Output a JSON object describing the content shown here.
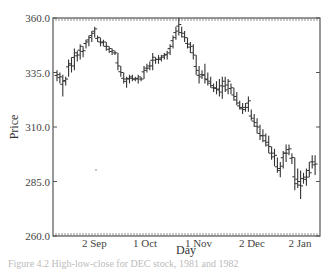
{
  "chart_data": {
    "type": "ohlc",
    "title": "",
    "xlabel": "Day",
    "ylabel": "Price",
    "ylim": [
      260.0,
      360.0
    ],
    "yticks": [
      "360.0",
      "335.0",
      "310.0",
      "285.0",
      "260.0"
    ],
    "ytick_values": [
      360,
      335,
      310,
      285,
      260
    ],
    "xticks": [
      "2 Sep",
      "1 Oct",
      "1 Nov",
      "2 Dec",
      "2 Jan"
    ],
    "xtick_positions": [
      0.155,
      0.345,
      0.545,
      0.745,
      0.925
    ],
    "grid": false,
    "legend": null,
    "series": [
      {
        "name": "High-Low-Close",
        "bars": [
          [
            336,
            331,
            334
          ],
          [
            335,
            330,
            333
          ],
          [
            334,
            324,
            331
          ],
          [
            333,
            329,
            332
          ],
          [
            341,
            333,
            339
          ],
          [
            342,
            335,
            338
          ],
          [
            346,
            336,
            344
          ],
          [
            345,
            340,
            343
          ],
          [
            348,
            341,
            347
          ],
          [
            347,
            342,
            345
          ],
          [
            350,
            346,
            349
          ],
          [
            352,
            347,
            351
          ],
          [
            354,
            349,
            353
          ],
          [
            356,
            351,
            355
          ],
          [
            352,
            349,
            351
          ],
          [
            351,
            347,
            349
          ],
          [
            350,
            347,
            349
          ],
          [
            349,
            345,
            347
          ],
          [
            347,
            344,
            346
          ],
          [
            346,
            343,
            345
          ],
          [
            345,
            343,
            344
          ],
          [
            344,
            336,
            338
          ],
          [
            338,
            333,
            335
          ],
          [
            335,
            330,
            332
          ],
          [
            333,
            328,
            332
          ],
          [
            334,
            330,
            333
          ],
          [
            334,
            331,
            332
          ],
          [
            333,
            331,
            332
          ],
          [
            334,
            330,
            333
          ],
          [
            333,
            331,
            332
          ],
          [
            338,
            332,
            336
          ],
          [
            339,
            335,
            337
          ],
          [
            340,
            336,
            338
          ],
          [
            344,
            336,
            342
          ],
          [
            342,
            339,
            341
          ],
          [
            343,
            339,
            341
          ],
          [
            343,
            340,
            342
          ],
          [
            344,
            341,
            343
          ],
          [
            345,
            341,
            344
          ],
          [
            348,
            343,
            347
          ],
          [
            352,
            346,
            351
          ],
          [
            356,
            350,
            354
          ],
          [
            360,
            352,
            357
          ],
          [
            356,
            351,
            353
          ],
          [
            354,
            349,
            351
          ],
          [
            351,
            346,
            348
          ],
          [
            349,
            344,
            347
          ],
          [
            348,
            341,
            343
          ],
          [
            343,
            334,
            336
          ],
          [
            338,
            330,
            333
          ],
          [
            336,
            332,
            334
          ],
          [
            339,
            330,
            332
          ],
          [
            335,
            329,
            331
          ],
          [
            333,
            328,
            329
          ],
          [
            330,
            326,
            328
          ],
          [
            331,
            325,
            327
          ],
          [
            332,
            324,
            326
          ],
          [
            333,
            323,
            331
          ],
          [
            333,
            326,
            327
          ],
          [
            332,
            325,
            331
          ],
          [
            330,
            325,
            328
          ],
          [
            328,
            322,
            324
          ],
          [
            326,
            320,
            321
          ],
          [
            322,
            318,
            319
          ],
          [
            321,
            316,
            318
          ],
          [
            321,
            317,
            319
          ],
          [
            324,
            317,
            322
          ],
          [
            318,
            313,
            314
          ],
          [
            316,
            310,
            312
          ],
          [
            314,
            307,
            310
          ],
          [
            311,
            304,
            306
          ],
          [
            309,
            303,
            306
          ],
          [
            307,
            301,
            303
          ],
          [
            306,
            298,
            301
          ],
          [
            301,
            295,
            298
          ],
          [
            300,
            292,
            297
          ],
          [
            296,
            289,
            290
          ],
          [
            294,
            287,
            292
          ],
          [
            299,
            291,
            298
          ],
          [
            302,
            294,
            298
          ],
          [
            302,
            297,
            300
          ],
          [
            298,
            293,
            296
          ],
          [
            296,
            281,
            284
          ],
          [
            291,
            282,
            285
          ],
          [
            290,
            277,
            283
          ],
          [
            289,
            284,
            286
          ],
          [
            291,
            283,
            287
          ],
          [
            294,
            287,
            289
          ],
          [
            297,
            291,
            294
          ],
          [
            297,
            288,
            293
          ]
        ]
      }
    ]
  },
  "caption": "Figure 4.2   High-low-close for DEC stock, 1981 and 1982"
}
